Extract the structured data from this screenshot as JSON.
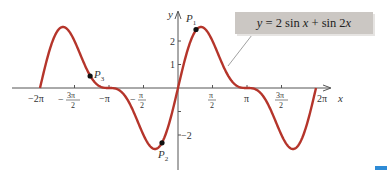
{
  "chart_data": {
    "type": "line",
    "title": "",
    "function": "y = 2 sin x + sin 2x",
    "legend": [
      "y = 2 sin x + sin 2x"
    ],
    "xlabel": "x",
    "ylabel": "y",
    "xlim": [
      -6.2832,
      6.2832
    ],
    "ylim": [
      -2.6,
      2.6
    ],
    "grid": false,
    "x_ticks": [
      "-2π",
      "-3π/2",
      "-π",
      "-π/2",
      "π/2",
      "π",
      "3π/2",
      "2π"
    ],
    "y_ticks": [
      "2",
      "1",
      "-2"
    ],
    "series": [
      {
        "name": "y = 2 sin x + sin 2x",
        "color": "#b5352b",
        "x": [
          -6.283,
          -5.236,
          -4.712,
          -4.189,
          -3.665,
          -3.142,
          -2.618,
          -2.094,
          -1.571,
          -1.047,
          -0.524,
          0,
          0.524,
          1.047,
          1.571,
          2.094,
          2.618,
          3.142,
          3.665,
          4.189,
          4.712,
          5.236,
          5.759,
          6.283
        ],
        "values": [
          0,
          2.598,
          2.0,
          0.866,
          0.134,
          0,
          -0.134,
          -0.866,
          -2.0,
          -2.598,
          -1.866,
          0,
          1.866,
          2.598,
          2.0,
          0.866,
          0.134,
          0,
          -0.134,
          -0.866,
          -2.0,
          -2.598,
          -1.866,
          0
        ]
      }
    ],
    "points": [
      {
        "label": "P1",
        "x": 0.82,
        "y": 2.49
      },
      {
        "label": "P2",
        "x": -0.73,
        "y": -2.33
      },
      {
        "label": "P3",
        "x": -4.0,
        "y": 0.51
      }
    ]
  },
  "labels": {
    "x_axis": "x",
    "y_axis": "y",
    "equation": "y = 2 sin x + sin 2x",
    "p1_main": "P",
    "p1_sub": "1",
    "p2_main": "P",
    "p2_sub": "2",
    "p3_main": "P",
    "p3_sub": "3",
    "neg_2pi": "−2π",
    "neg_3pi_2_num": "3π",
    "neg_3pi_2_den": "2",
    "neg_pi": "−π",
    "neg_pi_2_num": "π",
    "neg_pi_2_den": "2",
    "pi_2_num": "π",
    "pi_2_den": "2",
    "pi": "π",
    "three_pi_2_num": "3π",
    "three_pi_2_den": "2",
    "two_pi": "2π",
    "y_2": "2",
    "y_1": "1",
    "y_neg2": "−2"
  },
  "colors": {
    "curve": "#b5352b",
    "axis": "#555555",
    "equation_box": "#cbc7c3",
    "marker": "#111111",
    "accent_mark": "#2e8bd6"
  }
}
